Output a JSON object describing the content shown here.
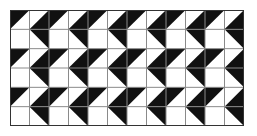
{
  "figure": {
    "rows": 6,
    "cols": 12,
    "colors": {
      "fill": "#111111",
      "background": "#ffffff",
      "gridline": "#8a8a8a",
      "border": "#333333"
    },
    "legend": {
      "TL": "black triangle above '/' diagonal (top-left)",
      "BR": "black triangle below '/' diagonal (bottom-right)",
      "TR": "black triangle above '\\' diagonal (top-right)",
      "W": "empty white cell"
    },
    "cells": [
      [
        "TL",
        "BR",
        "TL",
        "BR",
        "TL",
        "BR",
        "TL",
        "BR",
        "TL",
        "BR",
        "TL",
        "BR"
      ],
      [
        "W",
        "TR",
        "W",
        "TR",
        "W",
        "TR",
        "W",
        "TR",
        "W",
        "TR",
        "W",
        "TR"
      ],
      [
        "TL",
        "BR",
        "TL",
        "BR",
        "TL",
        "BR",
        "TL",
        "BR",
        "TL",
        "BR",
        "TL",
        "BR"
      ],
      [
        "W",
        "TR",
        "W",
        "TR",
        "W",
        "TR",
        "W",
        "TR",
        "W",
        "TR",
        "W",
        "TR"
      ],
      [
        "TL",
        "BR",
        "TL",
        "BR",
        "TL",
        "BR",
        "TL",
        "BR",
        "TL",
        "BR",
        "TL",
        "BR"
      ],
      [
        "W",
        "TR",
        "W",
        "TR",
        "W",
        "TR",
        "W",
        "TR",
        "W",
        "TR",
        "W",
        "TR"
      ]
    ]
  }
}
